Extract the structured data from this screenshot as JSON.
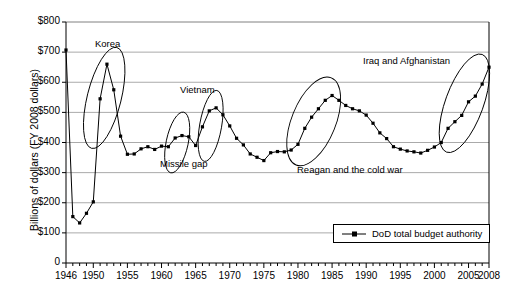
{
  "chart_data": {
    "type": "line",
    "title": "",
    "xlabel": "",
    "ylabel": "Billions of dollars (FY 2008 dollars)",
    "xlim": [
      1946,
      2008
    ],
    "ylim": [
      0,
      800
    ],
    "ytick_labels": [
      "0",
      "$100",
      "$200",
      "$300",
      "$400",
      "$500",
      "$600",
      "$700",
      "$800"
    ],
    "ytick_values": [
      0,
      100,
      200,
      300,
      400,
      500,
      600,
      700,
      800
    ],
    "xtick_labels": [
      "1946",
      "1950",
      "1955",
      "1960",
      "1965",
      "1970",
      "1975",
      "1980",
      "1985",
      "1990",
      "1995",
      "2000",
      "2005",
      "2008"
    ],
    "xtick_values": [
      1946,
      1950,
      1955,
      1960,
      1965,
      1970,
      1975,
      1980,
      1985,
      1990,
      1995,
      2000,
      2005,
      2008
    ],
    "grid": "horizontal",
    "legend_position": "bottom-right",
    "series": [
      {
        "name": "DoD total budget authority",
        "x": [
          1946,
          1947,
          1948,
          1949,
          1950,
          1951,
          1952,
          1953,
          1954,
          1955,
          1956,
          1957,
          1958,
          1959,
          1960,
          1961,
          1962,
          1963,
          1964,
          1965,
          1966,
          1967,
          1968,
          1969,
          1970,
          1971,
          1972,
          1973,
          1974,
          1975,
          1976,
          1977,
          1978,
          1979,
          1980,
          1981,
          1982,
          1983,
          1984,
          1985,
          1986,
          1987,
          1988,
          1989,
          1990,
          1991,
          1992,
          1993,
          1994,
          1995,
          1996,
          1997,
          1998,
          1999,
          2000,
          2001,
          2002,
          2003,
          2004,
          2005,
          2006,
          2007,
          2008
        ],
        "values": [
          707,
          154,
          133,
          165,
          203,
          545,
          660,
          575,
          421,
          361,
          362,
          379,
          386,
          377,
          388,
          386,
          415,
          423,
          419,
          390,
          452,
          505,
          515,
          492,
          455,
          414,
          392,
          362,
          351,
          340,
          366,
          370,
          369,
          375,
          394,
          447,
          484,
          512,
          540,
          556,
          540,
          523,
          512,
          505,
          491,
          464,
          432,
          413,
          386,
          378,
          372,
          369,
          365,
          374,
          385,
          400,
          447,
          469,
          490,
          535,
          554,
          594,
          650
        ]
      }
    ],
    "annotations": [
      {
        "label": "Korea"
      },
      {
        "label": "Missile gap"
      },
      {
        "label": "Vietnam"
      },
      {
        "label": "Reagan and the cold war"
      },
      {
        "label": "Iraq and Afghanistan"
      }
    ]
  },
  "legend": {
    "entry_label": "DoD total budget authority"
  },
  "colors": {
    "line": "#000000",
    "marker": "#000000",
    "grid": "#aaaaaa",
    "axis": "#000000",
    "background": "#ffffff"
  }
}
